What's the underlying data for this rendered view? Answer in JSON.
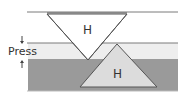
{
  "diagram": {
    "press_label": "Press",
    "upper_indenter_label": "H",
    "lower_indenter_label": "H",
    "colors": {
      "line": "#7a7a7a",
      "light_band": "#eeeeee",
      "dark_band": "#9a9a9a",
      "lower_triangle_fill": "#dcdcdc",
      "upper_triangle_fill": "#ffffff",
      "outline": "#555555"
    },
    "arrows": {
      "top": "down-arrow",
      "bottom": "up-arrow"
    }
  }
}
